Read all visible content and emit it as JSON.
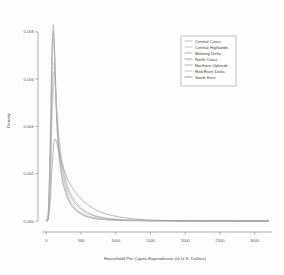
{
  "chart_data": {
    "type": "line",
    "title": "",
    "xlabel": "Household Per Capita Expenditures (in U.S. Dollars)",
    "ylabel": "Density",
    "xlim": [
      -120,
      3250
    ],
    "ylim": [
      0,
      0.0085
    ],
    "xticks": [
      0,
      500,
      1000,
      1500,
      2000,
      2500,
      3000
    ],
    "xticklabels": [
      "0",
      "500",
      "1000",
      "1500",
      "2000",
      "2500",
      "3000"
    ],
    "yticks": [
      0.0,
      0.002,
      0.004,
      0.006,
      0.008
    ],
    "yticklabels": [
      "0.000",
      "0.002",
      "0.004",
      "0.006",
      "0.008"
    ],
    "grid": false,
    "legend_position": "top-right",
    "x": [
      0,
      30,
      60,
      80,
      100,
      120,
      140,
      160,
      180,
      200,
      230,
      260,
      300,
      340,
      380,
      420,
      460,
      500,
      560,
      620,
      700,
      780,
      860,
      950,
      1050,
      1150,
      1300,
      1450,
      1600,
      1800,
      2000,
      2250,
      2500,
      2750,
      3000,
      3200
    ],
    "series": [
      {
        "name": "Central Coast",
        "color": "#b8b8b8",
        "values": [
          2e-05,
          0.0003,
          0.003,
          0.0062,
          0.0077,
          0.007,
          0.0052,
          0.004,
          0.0032,
          0.00265,
          0.00205,
          0.00165,
          0.0012,
          0.0009,
          0.0007,
          0.00055,
          0.00044,
          0.00036,
          0.00026,
          0.0002,
          0.00014,
          0.0001,
          8e-05,
          6e-05,
          4e-05,
          3e-05,
          2e-05,
          1.5e-05,
          1e-05,
          6e-06,
          4e-06,
          2e-06,
          1e-06,
          8e-07,
          5e-07,
          3e-07
        ]
      },
      {
        "name": "Central Highlands",
        "color": "#c2c2c2",
        "values": [
          2e-05,
          0.00025,
          0.0024,
          0.0052,
          0.0066,
          0.0064,
          0.005,
          0.00395,
          0.0032,
          0.0027,
          0.00215,
          0.00178,
          0.00135,
          0.00106,
          0.00086,
          0.0007,
          0.00058,
          0.00048,
          0.00036,
          0.00028,
          0.0002,
          0.00015,
          0.00011,
          8e-05,
          6e-05,
          4.5e-05,
          3e-05,
          2e-05,
          1.4e-05,
          9e-06,
          6e-06,
          3e-06,
          2e-06,
          1e-06,
          7e-07,
          4e-07
        ]
      },
      {
        "name": "Mekong Delta",
        "color": "#ababab",
        "values": [
          2e-05,
          0.00022,
          0.0021,
          0.0047,
          0.0061,
          0.00625,
          0.0052,
          0.0042,
          0.00345,
          0.0029,
          0.0023,
          0.0019,
          0.00145,
          0.00114,
          0.00092,
          0.00075,
          0.00062,
          0.00051,
          0.00038,
          0.00029,
          0.00021,
          0.00015,
          0.00011,
          8e-05,
          6e-05,
          4.5e-05,
          3e-05,
          2e-05,
          1.3e-05,
          8e-06,
          5e-06,
          3e-06,
          2e-06,
          1e-06,
          6e-07,
          4e-07
        ]
      },
      {
        "name": "North Coast",
        "color": "#9e9e9e",
        "values": [
          3e-05,
          0.00045,
          0.0036,
          0.0069,
          0.0083,
          0.0072,
          0.0052,
          0.0038,
          0.00295,
          0.0024,
          0.00182,
          0.00145,
          0.00105,
          0.00079,
          0.00061,
          0.00048,
          0.00038,
          0.00031,
          0.00022,
          0.00016,
          0.00011,
          8e-05,
          6e-05,
          4e-05,
          3e-05,
          2e-05,
          1.3e-05,
          9e-06,
          6e-06,
          4e-06,
          2e-06,
          1e-06,
          8e-07,
          5e-07,
          3e-07,
          2e-07
        ]
      },
      {
        "name": "Northern Uplands",
        "color": "#a5a5a5",
        "values": [
          3e-05,
          0.0005,
          0.0039,
          0.007,
          0.008,
          0.0068,
          0.0049,
          0.0036,
          0.00278,
          0.00225,
          0.0017,
          0.00135,
          0.00098,
          0.00074,
          0.00057,
          0.00045,
          0.00036,
          0.00029,
          0.0002,
          0.00015,
          0.0001,
          7e-05,
          5e-05,
          3.5e-05,
          2.5e-05,
          1.8e-05,
          1.1e-05,
          7e-06,
          5e-06,
          3e-06,
          2e-06,
          1e-06,
          6e-07,
          4e-07,
          3e-07,
          2e-07
        ]
      },
      {
        "name": "Red River Delta",
        "color": "#bdbdbd",
        "values": [
          2e-05,
          0.0002,
          0.0017,
          0.004,
          0.00545,
          0.0059,
          0.0052,
          0.0044,
          0.0037,
          0.00315,
          0.00252,
          0.00208,
          0.0016,
          0.00127,
          0.00103,
          0.00085,
          0.0007,
          0.00058,
          0.00044,
          0.00034,
          0.00024,
          0.00018,
          0.00013,
          0.0001,
          7e-05,
          5e-05,
          3.4e-05,
          2.3e-05,
          1.6e-05,
          1e-05,
          6e-06,
          4e-06,
          2e-06,
          1e-06,
          8e-07,
          5e-07
        ]
      },
      {
        "name": "South East",
        "color": "#8f8f8f",
        "values": [
          1e-05,
          0.00012,
          0.00095,
          0.00215,
          0.00305,
          0.00345,
          0.0034,
          0.00318,
          0.00292,
          0.00268,
          0.00238,
          0.00212,
          0.00182,
          0.00158,
          0.00138,
          0.00121,
          0.00106,
          0.00093,
          0.00077,
          0.00064,
          0.00049,
          0.00038,
          0.0003,
          0.00023,
          0.00017,
          0.00013,
          8e-05,
          5e-05,
          3.4e-05,
          2e-05,
          1.2e-05,
          6e-06,
          3e-06,
          2e-06,
          1e-06,
          6e-07
        ]
      }
    ]
  },
  "legend": {
    "entries": [
      "Central Coast",
      "Central Highlands",
      "Mekong Delta",
      "North Coast",
      "Northern Uplands",
      "Red River Delta",
      "South East"
    ]
  }
}
